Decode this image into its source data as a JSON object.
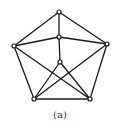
{
  "caption": "(a)",
  "colors": {
    "edge": "#1a1a1a",
    "node_stroke": "#1a1a1a",
    "node_fill": "#ffffff"
  },
  "graph": {
    "nodes": [
      {
        "id": "top",
        "x": 59,
        "y": 12
      },
      {
        "id": "mid",
        "x": 59,
        "y": 37
      },
      {
        "id": "inner",
        "x": 60,
        "y": 62
      },
      {
        "id": "left",
        "x": 14,
        "y": 46
      },
      {
        "id": "right",
        "x": 107,
        "y": 44
      },
      {
        "id": "bottom-left",
        "x": 34,
        "y": 99
      },
      {
        "id": "bottom-right",
        "x": 90,
        "y": 99
      }
    ],
    "edges": [
      [
        "top",
        "left"
      ],
      [
        "top",
        "right"
      ],
      [
        "top",
        "mid"
      ],
      [
        "left",
        "bottom-left"
      ],
      [
        "right",
        "bottom-right"
      ],
      [
        "bottom-left",
        "bottom-right"
      ],
      [
        "mid",
        "left"
      ],
      [
        "mid",
        "right"
      ],
      [
        "mid",
        "inner"
      ],
      [
        "inner",
        "bottom-left"
      ],
      [
        "inner",
        "bottom-right"
      ],
      [
        "left",
        "bottom-right"
      ],
      [
        "right",
        "bottom-left"
      ]
    ]
  }
}
